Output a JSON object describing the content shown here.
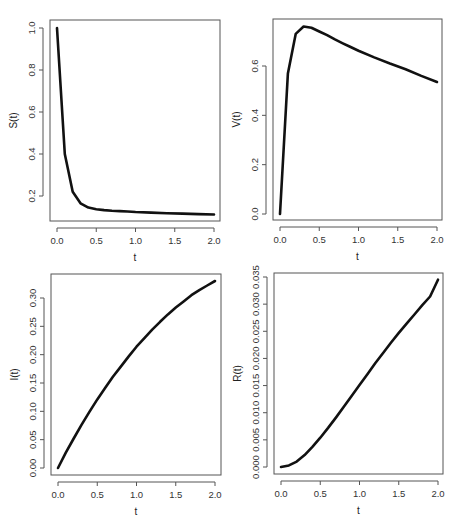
{
  "figure": {
    "panel_count": 4,
    "line_color": "#111111",
    "frame_color": "#555555"
  },
  "chart_data": [
    {
      "type": "line",
      "id": "S",
      "title": "",
      "xlabel": "t",
      "ylabel": "S(t)",
      "xlim": [
        0,
        2
      ],
      "ylim": [
        0.11,
        1.0
      ],
      "grid": false,
      "x_ticks": [
        0.0,
        0.5,
        1.0,
        1.5,
        2.0
      ],
      "x_tick_labels": [
        "0.0",
        "0.5",
        "1.0",
        "1.5",
        "2.0"
      ],
      "y_ticks": [
        0.2,
        0.4,
        0.6,
        0.8,
        1.0
      ],
      "y_tick_labels": [
        "0.2",
        "0.4",
        "0.6",
        "0.8",
        "1.0"
      ],
      "x": [
        0.0,
        0.1,
        0.2,
        0.3,
        0.4,
        0.5,
        0.6,
        0.7,
        0.8,
        0.9,
        1.0,
        1.2,
        1.4,
        1.6,
        1.8,
        2.0
      ],
      "y": [
        1.0,
        0.4,
        0.22,
        0.165,
        0.145,
        0.137,
        0.133,
        0.13,
        0.128,
        0.126,
        0.124,
        0.121,
        0.118,
        0.116,
        0.114,
        0.112
      ],
      "layout": {
        "left": 50,
        "top": 20,
        "right": 220,
        "bottom": 221,
        "x0px": 57,
        "x1px": 214,
        "y_at_ref0": 196,
        "ref0": 0.2,
        "y_at_ref1": 28,
        "ref1": 1.0
      }
    },
    {
      "type": "line",
      "id": "V",
      "title": "",
      "xlabel": "t",
      "ylabel": "V(t)",
      "xlim": [
        0,
        2
      ],
      "ylim": [
        0.0,
        0.76
      ],
      "grid": false,
      "x_ticks": [
        0.0,
        0.5,
        1.0,
        1.5,
        2.0
      ],
      "x_tick_labels": [
        "0.0",
        "0.5",
        "1.0",
        "1.5",
        "2.0"
      ],
      "y_ticks": [
        0.0,
        0.2,
        0.4,
        0.6
      ],
      "y_tick_labels": [
        "0.0",
        "0.2",
        "0.4",
        "0.6"
      ],
      "x": [
        0.0,
        0.1,
        0.2,
        0.3,
        0.4,
        0.5,
        0.6,
        0.7,
        0.8,
        0.9,
        1.0,
        1.2,
        1.4,
        1.6,
        1.8,
        2.0
      ],
      "y": [
        0.0,
        0.57,
        0.73,
        0.76,
        0.755,
        0.74,
        0.725,
        0.708,
        0.692,
        0.677,
        0.662,
        0.635,
        0.61,
        0.587,
        0.56,
        0.535
      ],
      "layout": {
        "left": 273,
        "top": 19,
        "right": 442,
        "bottom": 220,
        "x0px": 280,
        "x1px": 437,
        "y_at_ref0": 214,
        "ref0": 0.0,
        "y_at_ref1": 66,
        "ref1": 0.6
      }
    },
    {
      "type": "line",
      "id": "I",
      "title": "",
      "xlabel": "t",
      "ylabel": "I(t)",
      "xlim": [
        0,
        2
      ],
      "ylim": [
        0.0,
        0.33
      ],
      "grid": false,
      "x_ticks": [
        0.0,
        0.5,
        1.0,
        1.5,
        2.0
      ],
      "x_tick_labels": [
        "0.0",
        "0.5",
        "1.0",
        "1.5",
        "2.0"
      ],
      "y_ticks": [
        0.0,
        0.05,
        0.1,
        0.15,
        0.2,
        0.25,
        0.3
      ],
      "y_tick_labels": [
        "0.00",
        "0.05",
        "0.10",
        "0.15",
        "0.20",
        "0.25",
        "0.30"
      ],
      "x": [
        0.0,
        0.1,
        0.2,
        0.3,
        0.4,
        0.5,
        0.6,
        0.7,
        0.8,
        0.9,
        1.0,
        1.1,
        1.2,
        1.3,
        1.4,
        1.5,
        1.6,
        1.7,
        1.8,
        1.9,
        2.0
      ],
      "y": [
        0.0,
        0.027,
        0.052,
        0.076,
        0.099,
        0.121,
        0.141,
        0.161,
        0.179,
        0.197,
        0.214,
        0.229,
        0.244,
        0.258,
        0.271,
        0.283,
        0.294,
        0.305,
        0.314,
        0.322,
        0.33
      ],
      "layout": {
        "left": 51,
        "top": 274,
        "right": 221,
        "bottom": 475,
        "x0px": 58,
        "x1px": 215,
        "y_at_ref0": 468,
        "ref0": 0.0,
        "y_at_ref1": 298,
        "ref1": 0.3
      }
    },
    {
      "type": "line",
      "id": "R",
      "title": "",
      "xlabel": "t",
      "ylabel": "R(t)",
      "xlim": [
        0,
        2
      ],
      "ylim": [
        0.0,
        0.0345
      ],
      "grid": false,
      "x_ticks": [
        0.0,
        0.5,
        1.0,
        1.5,
        2.0
      ],
      "x_tick_labels": [
        "0.0",
        "0.5",
        "1.0",
        "1.5",
        "2.0"
      ],
      "y_ticks": [
        0.0,
        0.005,
        0.01,
        0.015,
        0.02,
        0.025,
        0.03,
        0.035
      ],
      "y_tick_labels": [
        "0.000",
        "0.005",
        "0.010",
        "0.015",
        "0.020",
        "0.025",
        "0.030",
        "0.035"
      ],
      "x": [
        0.0,
        0.1,
        0.2,
        0.3,
        0.4,
        0.5,
        0.6,
        0.7,
        0.8,
        0.9,
        1.0,
        1.1,
        1.2,
        1.3,
        1.4,
        1.5,
        1.6,
        1.7,
        1.8,
        1.9,
        2.0
      ],
      "y": [
        0.0,
        0.0003,
        0.001,
        0.0022,
        0.0037,
        0.0054,
        0.0072,
        0.0091,
        0.0111,
        0.0131,
        0.0151,
        0.0171,
        0.0191,
        0.021,
        0.0229,
        0.0247,
        0.0264,
        0.0281,
        0.0298,
        0.0314,
        0.0345
      ],
      "layout": {
        "left": 274,
        "top": 273,
        "right": 443,
        "bottom": 474,
        "x0px": 281,
        "x1px": 438,
        "y_at_ref0": 467,
        "ref0": 0.0,
        "y_at_ref1": 277,
        "ref1": 0.035
      }
    }
  ]
}
